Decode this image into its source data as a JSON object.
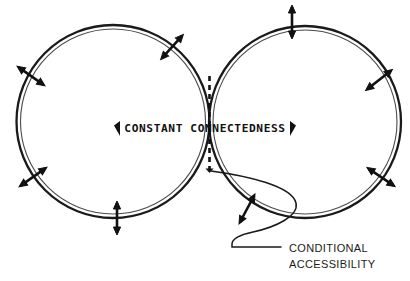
{
  "diagram": {
    "background_color": "#ffffff",
    "stroke_color": "#1a1a1a",
    "center_label": {
      "text": "CONSTANT CONNECTEDNESS",
      "left_marker_icon": "left-triangle-marker",
      "right_marker_icon": "right-triangle-marker",
      "x": 205,
      "y": 131
    },
    "callout": {
      "line1": "CONDITIONAL",
      "line2": "ACCESSIBILITY",
      "x": 289,
      "y1": 253,
      "y2": 269
    },
    "divider": {
      "name": "tangency-dashed-line",
      "x": 209.5,
      "y_top": 76,
      "y_bottom": 175,
      "dash": "5 4",
      "width": 2.6
    },
    "circles": [
      {
        "name": "left-circle",
        "cx": 113,
        "cy": 121.5,
        "r_outer": 96.5,
        "r_inner": 92.5
      },
      {
        "name": "right-circle",
        "cx": 305,
        "cy": 122,
        "r_outer": 96,
        "r_inner": 92
      }
    ],
    "arrows": [
      {
        "name": "arrow-left-circle-upper-right",
        "cx": 172.0,
        "cy": 47.0,
        "angle": -48,
        "length": 34
      },
      {
        "name": "arrow-left-circle-left-upper",
        "cx": 31.0,
        "cy": 76.0,
        "angle": 35,
        "length": 34
      },
      {
        "name": "arrow-left-circle-left-lower",
        "cx": 33.0,
        "cy": 177.0,
        "angle": -35,
        "length": 34
      },
      {
        "name": "arrow-left-circle-bottom",
        "cx": 117.0,
        "cy": 218.0,
        "angle": 90,
        "length": 34
      },
      {
        "name": "arrow-right-circle-top",
        "cx": 292.0,
        "cy": 22.0,
        "angle": 90,
        "length": 34
      },
      {
        "name": "arrow-right-circle-right-upper",
        "cx": 379.0,
        "cy": 80.0,
        "angle": -38,
        "length": 34
      },
      {
        "name": "arrow-right-circle-right-lower",
        "cx": 381.0,
        "cy": 177.0,
        "angle": 34,
        "length": 34
      },
      {
        "name": "arrow-right-circle-bottom-left",
        "cx": 247.0,
        "cy": 209.0,
        "angle": -62,
        "length": 34
      }
    ],
    "leader": {
      "name": "callout-leader-curve",
      "tip_x": 211,
      "tip_y": 170
    }
  }
}
